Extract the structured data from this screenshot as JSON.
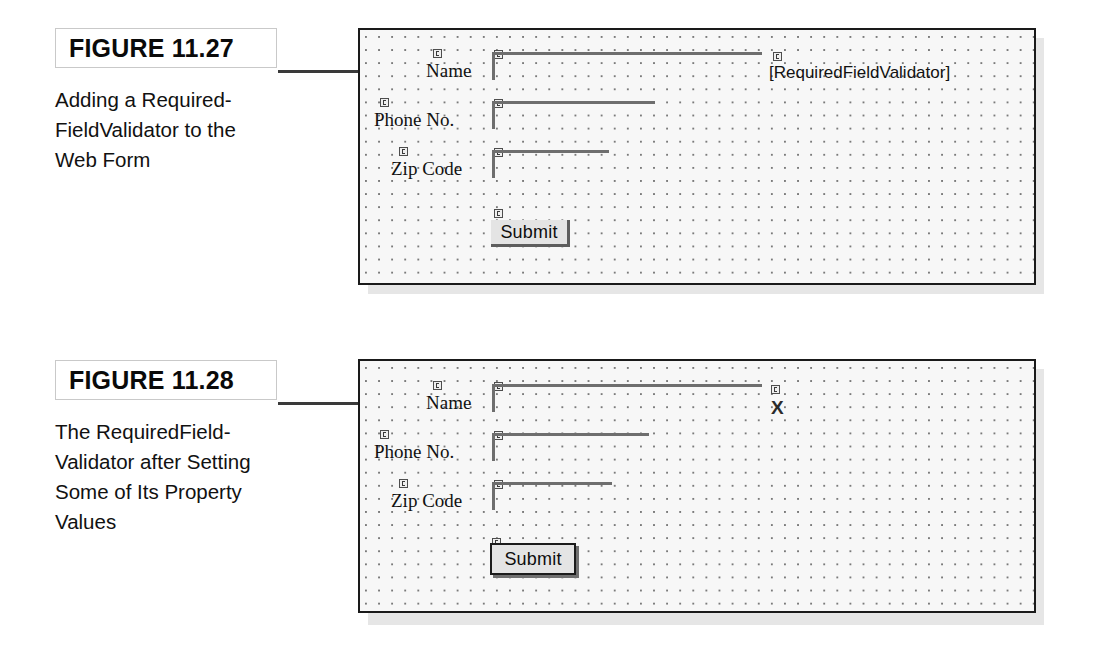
{
  "page": {
    "background_color": "#ffffff",
    "panel_border_color": "#1a1a1a",
    "panel_background_color": "#f7f7f7",
    "panel_shadow_color": "#e6e6e6",
    "grid_dot_color": "#7a7a7a"
  },
  "figures": [
    {
      "id": "figure-11-27",
      "label": "FIGURE 11.27",
      "caption": "Adding a Required-FieldValidator to the Web Form",
      "designer": {
        "fields": [
          {
            "label": "Name",
            "glyph": "server-control-glyph"
          },
          {
            "label": "Phone No.",
            "glyph": "server-control-glyph"
          },
          {
            "label": "Zip Code",
            "glyph": "server-control-glyph"
          }
        ],
        "submit_label": "Submit",
        "validator_text": "[RequiredFieldValidator]"
      }
    },
    {
      "id": "figure-11-28",
      "label": "FIGURE 11.28",
      "caption": "The RequiredField-Validator after Setting Some of Its Property Values",
      "designer": {
        "fields": [
          {
            "label": "Name",
            "glyph": "server-control-glyph"
          },
          {
            "label": "Phone No.",
            "glyph": "server-control-glyph"
          },
          {
            "label": "Zip Code",
            "glyph": "server-control-glyph"
          }
        ],
        "submit_label": "Submit",
        "validator_text": "X"
      }
    }
  ]
}
